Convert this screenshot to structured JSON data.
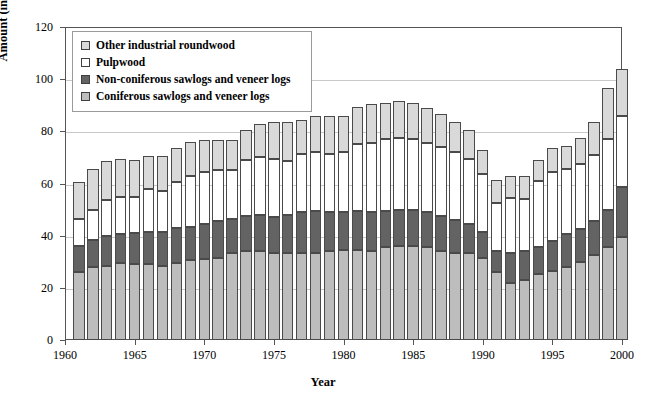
{
  "chart_data": {
    "type": "bar",
    "subtype": "stacked-bar",
    "title": "",
    "xlabel": "Year",
    "ylabel": "Amount (in million cubic metres)",
    "xlim": [
      1960,
      2000
    ],
    "ylim": [
      0,
      120
    ],
    "ytick_labels": [
      "0",
      "20",
      "40",
      "60",
      "80",
      "100",
      "120"
    ],
    "ytick_values": [
      0,
      20,
      40,
      60,
      80,
      100,
      120
    ],
    "xtick_labels": [
      "1960",
      "1965",
      "1970",
      "1975",
      "1980",
      "1985",
      "1990",
      "1995",
      "2000"
    ],
    "xtick_values": [
      1960,
      1965,
      1970,
      1975,
      1980,
      1985,
      1990,
      1995,
      2000
    ],
    "grid": true,
    "grid_axis": "y",
    "legend_position": "upper-left-inside",
    "x": [
      1961,
      1962,
      1963,
      1964,
      1965,
      1966,
      1967,
      1968,
      1969,
      1970,
      1971,
      1972,
      1973,
      1974,
      1975,
      1976,
      1977,
      1978,
      1979,
      1980,
      1981,
      1982,
      1983,
      1984,
      1985,
      1986,
      1987,
      1988,
      1989,
      1990,
      1991,
      1992,
      1993,
      1994,
      1995,
      1996,
      1997,
      1998,
      1999,
      2000
    ],
    "categories": [
      "1961",
      "1962",
      "1963",
      "1964",
      "1965",
      "1966",
      "1967",
      "1968",
      "1969",
      "1970",
      "1971",
      "1972",
      "1973",
      "1974",
      "1975",
      "1976",
      "1977",
      "1978",
      "1979",
      "1980",
      "1981",
      "1982",
      "1983",
      "1984",
      "1985",
      "1986",
      "1987",
      "1988",
      "1989",
      "1990",
      "1991",
      "1992",
      "1993",
      "1994",
      "1995",
      "1996",
      "1997",
      "1998",
      "1999",
      "2000"
    ],
    "series": [
      {
        "name": "Coniferous sawlogs and veneer logs",
        "color": "#bdbdbd",
        "values": [
          26.0,
          28.0,
          28.5,
          29.5,
          29.0,
          29.0,
          28.5,
          29.5,
          30.5,
          31.0,
          31.5,
          33.5,
          34.0,
          34.0,
          33.5,
          33.5,
          33.5,
          33.5,
          34.0,
          34.5,
          34.5,
          34.0,
          35.5,
          36.0,
          36.0,
          35.5,
          34.0,
          33.5,
          33.5,
          31.5,
          26.0,
          22.0,
          23.0,
          25.5,
          26.5,
          28.0,
          30.0,
          32.5,
          35.5,
          39.5
        ]
      },
      {
        "name": "Non-coniferous sawlogs and veneer logs",
        "color": "#636363",
        "values": [
          10.0,
          10.5,
          11.5,
          11.0,
          12.0,
          12.5,
          13.0,
          13.5,
          13.0,
          13.5,
          14.0,
          13.0,
          13.5,
          14.0,
          13.5,
          14.5,
          15.5,
          16.0,
          15.0,
          14.5,
          15.0,
          15.0,
          14.0,
          14.0,
          14.0,
          13.5,
          13.5,
          12.5,
          11.0,
          10.0,
          8.0,
          11.5,
          11.0,
          10.0,
          11.5,
          12.5,
          12.5,
          13.0,
          14.5,
          19.0
        ]
      },
      {
        "name": "Pulpwood",
        "color": "#ffffff",
        "values": [
          10.5,
          11.5,
          13.5,
          14.5,
          14.0,
          16.5,
          15.5,
          17.5,
          19.5,
          20.0,
          19.5,
          18.5,
          21.5,
          22.0,
          22.5,
          20.5,
          22.5,
          22.5,
          22.5,
          23.0,
          25.5,
          26.5,
          27.5,
          27.5,
          27.0,
          26.5,
          26.5,
          26.0,
          25.0,
          22.0,
          18.5,
          21.0,
          20.0,
          25.5,
          26.5,
          25.0,
          25.0,
          25.5,
          27.0,
          27.5
        ]
      },
      {
        "name": "Other industrial roundwood",
        "color": "#d9d9d9",
        "values": [
          14.0,
          15.5,
          15.0,
          14.5,
          14.0,
          12.5,
          13.5,
          13.0,
          13.0,
          12.0,
          11.5,
          11.5,
          11.5,
          13.0,
          14.0,
          15.0,
          13.0,
          14.0,
          14.5,
          14.0,
          14.5,
          15.0,
          14.0,
          14.0,
          14.0,
          13.5,
          12.5,
          11.5,
          11.0,
          9.5,
          9.0,
          8.5,
          9.0,
          8.0,
          9.0,
          9.0,
          10.0,
          12.5,
          19.5,
          18.0
        ]
      }
    ],
    "totals": [
      60.5,
      65.5,
      68.5,
      69.5,
      69.0,
      70.5,
      70.5,
      73.5,
      76.0,
      76.5,
      76.5,
      76.5,
      80.5,
      83.0,
      83.5,
      83.5,
      84.5,
      86.0,
      86.0,
      86.0,
      89.5,
      90.5,
      91.0,
      91.5,
      91.0,
      89.0,
      86.5,
      83.5,
      80.5,
      73.0,
      61.5,
      63.0,
      63.0,
      69.0,
      73.5,
      74.5,
      77.5,
      83.5,
      96.5,
      104.0
    ]
  },
  "legend": {
    "items": [
      {
        "label": "Other industrial roundwood",
        "icon": "legend-swatch-icon"
      },
      {
        "label": "Pulpwood",
        "icon": "legend-swatch-icon"
      },
      {
        "label": "Non-coniferous sawlogs and veneer logs",
        "icon": "legend-swatch-icon"
      },
      {
        "label": "Coniferous sawlogs and veneer logs",
        "icon": "legend-swatch-icon"
      }
    ]
  },
  "colors": {
    "other_industrial_roundwood": "#d9d9d9",
    "pulpwood": "#ffffff",
    "non_coniferous": "#636363",
    "coniferous": "#bdbdbd",
    "axis": "#555555",
    "grid": "#c9c9c9",
    "bar_outline": "#4a4a4a"
  }
}
